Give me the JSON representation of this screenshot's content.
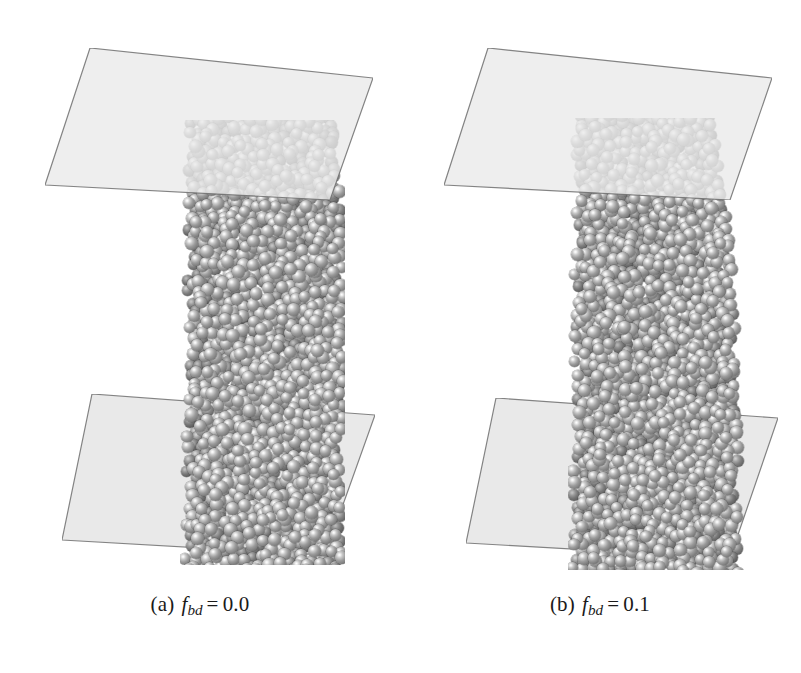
{
  "figure": {
    "type": "simulation-snapshot-figure",
    "background_color": "#ffffff",
    "panel_count": 2
  },
  "panels": [
    {
      "id": "a",
      "caption": {
        "label": "(a)",
        "variable": "f",
        "subscript": "bd",
        "equals": "=",
        "value": "0.0",
        "full_text": "(a) f_bd = 0.0"
      },
      "particle_color": "#8a8a8a",
      "particle_highlight_color": "#ffffff",
      "plates": [
        {
          "name": "top-plate",
          "fill": "#eaeaea",
          "stroke": "#6f6f6f",
          "opacity": 0.8,
          "translucent": true
        },
        {
          "name": "bottom-plate",
          "fill": "#e9e9e9",
          "stroke": "#6f6f6f",
          "opacity": 1.0,
          "translucent": false
        }
      ],
      "column": {
        "shape": "straight-slightly-tapered",
        "top_width_px": 148,
        "bottom_width_px": 160,
        "height_px": 420
      }
    },
    {
      "id": "b",
      "caption": {
        "label": "(b)",
        "variable": "f",
        "subscript": "bd",
        "equals": "=",
        "value": "0.1",
        "full_text": "(b) f_bd = 0.1"
      },
      "particle_color": "#8a8a8a",
      "particle_highlight_color": "#ffffff",
      "plates": [
        {
          "name": "top-plate",
          "fill": "#eaeaea",
          "stroke": "#6f6f6f",
          "opacity": 0.8,
          "translucent": true
        },
        {
          "name": "bottom-plate",
          "fill": "#e9e9e9",
          "stroke": "#6f6f6f",
          "opacity": 1.0,
          "translucent": false
        }
      ],
      "column": {
        "shape": "barrelled-wider-at-base",
        "top_width_px": 140,
        "bottom_width_px": 170,
        "height_px": 430
      }
    }
  ],
  "chart_data": {
    "type": "scatter",
    "title": "",
    "xlabel": "",
    "ylabel": "",
    "series": [
      {
        "name": "panel-a-particles",
        "description": "dense packing of monodisperse spheres in column (a), f_bd = 0.0"
      },
      {
        "name": "panel-b-particles",
        "description": "dense packing of monodisperse spheres in column (b), f_bd = 0.1"
      }
    ],
    "annotations": [
      "(a) f_bd = 0.0",
      "(b) f_bd = 0.1"
    ],
    "grid": false,
    "legend": "none"
  }
}
